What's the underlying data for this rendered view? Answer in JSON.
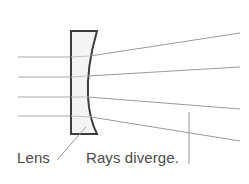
{
  "figure": {
    "width": 249,
    "height": 184,
    "background_color": "#ffffff"
  },
  "labels": {
    "lens": "Lens",
    "rays": "Rays diverge.",
    "text_color": "#4a4a4a",
    "font_size_px": 15
  },
  "lens": {
    "name": "concave-diverging-lens",
    "outline_color": "#3c3c3c",
    "fill_color": "#f4f5f3",
    "outline_width_px": 2,
    "left_edge_x": 71,
    "right_edge_x": 97,
    "top_y": 31,
    "bottom_y": 134,
    "shape": "plano-concave",
    "concave_side": "right"
  },
  "rays": {
    "color": "#9a9a9a",
    "width_px": 1,
    "incoming_color": "#a8a8a8",
    "count": 4,
    "incoming": [
      {
        "name": "incoming-ray-1",
        "x1": 18,
        "y1": 57,
        "x2": 71,
        "y2": 57
      },
      {
        "name": "incoming-ray-2",
        "x1": 18,
        "y1": 77,
        "x2": 71,
        "y2": 77
      },
      {
        "name": "incoming-ray-3",
        "x1": 18,
        "y1": 97,
        "x2": 71,
        "y2": 97
      },
      {
        "name": "incoming-ray-4",
        "x1": 18,
        "y1": 116,
        "x2": 71,
        "y2": 116
      }
    ],
    "inside_lens": [
      {
        "name": "lens-internal-ray-1",
        "x1": 71,
        "y1": 57,
        "x2": 92,
        "y2": 56
      },
      {
        "name": "lens-internal-ray-2",
        "x1": 71,
        "y1": 77,
        "x2": 90,
        "y2": 76
      },
      {
        "name": "lens-internal-ray-3",
        "x1": 71,
        "y1": 97,
        "x2": 90,
        "y2": 97
      },
      {
        "name": "lens-internal-ray-4",
        "x1": 71,
        "y1": 116,
        "x2": 93,
        "y2": 117
      }
    ],
    "outgoing": [
      {
        "name": "diverging-ray-1",
        "x1": 92,
        "y1": 56,
        "x2": 240,
        "y2": 33
      },
      {
        "name": "diverging-ray-2",
        "x1": 90,
        "y1": 76,
        "x2": 240,
        "y2": 67
      },
      {
        "name": "diverging-ray-3",
        "x1": 90,
        "y1": 97,
        "x2": 240,
        "y2": 109
      },
      {
        "name": "diverging-ray-4",
        "x1": 93,
        "y1": 117,
        "x2": 240,
        "y2": 141
      }
    ]
  },
  "leader_line": {
    "name": "lens-leader-line",
    "color": "#9a9a9a",
    "x1": 57,
    "y1": 160,
    "x2": 86,
    "y2": 127
  },
  "reference_line": {
    "name": "vertical-reference-line",
    "color": "#9a9a9a",
    "x": 189,
    "y1": 112,
    "y2": 164
  }
}
